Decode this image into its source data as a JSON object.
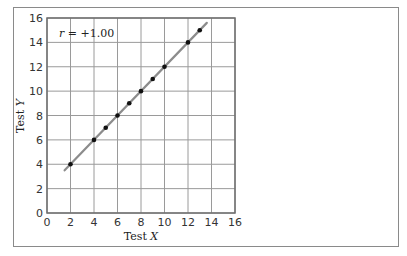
{
  "chart_data": {
    "type": "scatter",
    "title": "",
    "xlabel": "Test X",
    "ylabel": "Test Y",
    "xlim": [
      0,
      16
    ],
    "ylim": [
      0,
      16
    ],
    "x_ticks": [
      0,
      2,
      4,
      6,
      8,
      10,
      12,
      14,
      16
    ],
    "y_ticks": [
      0,
      2,
      4,
      6,
      8,
      10,
      12,
      14,
      16
    ],
    "grid": true,
    "legend": null,
    "annotation": "r = +1.00",
    "series": [
      {
        "name": "scores",
        "points": [
          {
            "x": 2,
            "y": 4
          },
          {
            "x": 4,
            "y": 6
          },
          {
            "x": 5,
            "y": 7
          },
          {
            "x": 6,
            "y": 8
          },
          {
            "x": 7,
            "y": 9
          },
          {
            "x": 8,
            "y": 10
          },
          {
            "x": 9,
            "y": 11
          },
          {
            "x": 10,
            "y": 12
          },
          {
            "x": 12,
            "y": 14
          },
          {
            "x": 13,
            "y": 15
          }
        ]
      }
    ],
    "regression_line": {
      "slope": 1,
      "intercept": 2,
      "x_start": 1.5,
      "x_end": 13.6,
      "color": "#8c8c8c"
    }
  },
  "labels": {
    "xlabel_prefix": "Test ",
    "xlabel_var": "X",
    "ylabel_prefix": "Test ",
    "ylabel_var": "Y",
    "annotation_var": "r",
    "annotation_rest": " = +1.00"
  },
  "colors": {
    "grid": "#9a9a9a",
    "axis": "#6e6e6e",
    "point": "#111111",
    "line": "#8c8c8c",
    "frame": "#8a8a8a"
  }
}
